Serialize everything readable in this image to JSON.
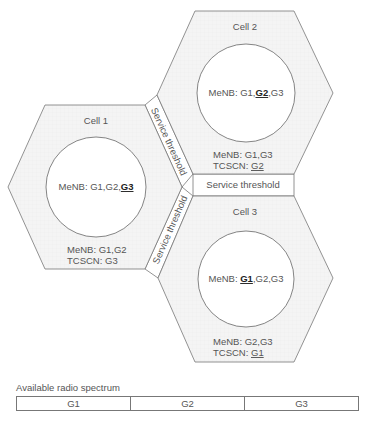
{
  "cells": [
    {
      "name": "Cell 1",
      "inner": {
        "prefix": "MeNB: ",
        "parts": [
          "G1,G2,",
          "G3"
        ],
        "highlight_index": 1
      },
      "outer_menb": "MeNB: G1,G2",
      "outer_tcscn_prefix": "TCSCN: ",
      "outer_tcscn_value": "G3"
    },
    {
      "name": "Cell 2",
      "inner": {
        "prefix": "MeNB: G1,",
        "highlight": "G2",
        "suffix": ",G3"
      },
      "outer_menb": "MeNB: G1,G3",
      "outer_tcscn_prefix": "TCSCN: ",
      "outer_tcscn_value": "G2"
    },
    {
      "name": "Cell 3",
      "inner": {
        "prefix": "MeNB: ",
        "highlight": "G1",
        "suffix": ",G2,G3"
      },
      "outer_menb": "MeNB: G2,G3",
      "outer_tcscn_prefix": "TCSCN: ",
      "outer_tcscn_value": "G1"
    }
  ],
  "thresholds": {
    "cell1_cell2": "Service threshold",
    "cell2_cell3": "Service threshold",
    "cell1_cell3": "Service threshold"
  },
  "spectrum": {
    "title": "Available radio spectrum",
    "bands": [
      "G1",
      "G2",
      "G3"
    ]
  },
  "colors": {
    "hex_fill": "#f3f3f3",
    "stroke": "#777777",
    "text": "#555555",
    "highlight_text": "#222222"
  }
}
